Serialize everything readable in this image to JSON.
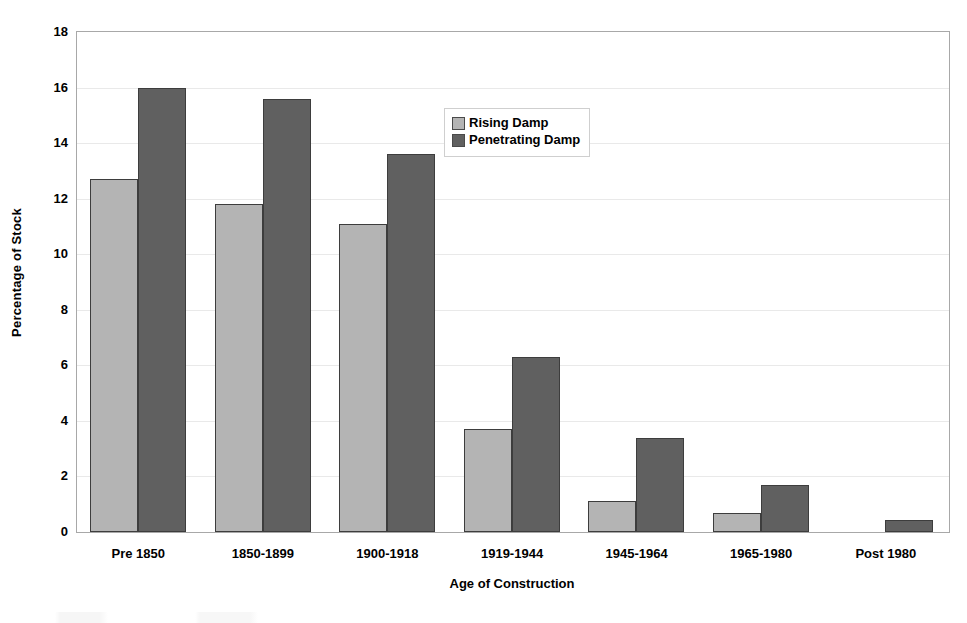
{
  "chart_data": {
    "type": "bar",
    "title": "",
    "xlabel": "Age of Construction",
    "ylabel": "Percentage of Stock",
    "categories": [
      "Pre 1850",
      "1850-1899",
      "1900-1918",
      "1919-1944",
      "1945-1964",
      "1965-1980",
      "Post 1980"
    ],
    "series": [
      {
        "name": "Rising Damp",
        "color": "#b4b4b4",
        "values": [
          12.7,
          11.8,
          11.1,
          3.7,
          1.1,
          0.7,
          null
        ]
      },
      {
        "name": "Penetrating Damp",
        "color": "#606060",
        "values": [
          16.0,
          15.6,
          13.6,
          6.3,
          3.4,
          1.7,
          0.45
        ]
      }
    ],
    "ylim": [
      0,
      18
    ],
    "yticks": [
      0,
      2,
      4,
      6,
      8,
      10,
      12,
      14,
      16,
      18
    ],
    "ytick_labels": [
      "0",
      "2",
      "4",
      "6",
      "8",
      "10",
      "12",
      "14",
      "16",
      "18"
    ],
    "grid": true,
    "grid_axis": "y",
    "legend_position": "upper center",
    "legend_entries": [
      "Rising Damp",
      "Penetrating Damp"
    ],
    "bar_border_color": "#3d3d3d",
    "plot_border_color": "#a8a8a8",
    "gridline_color": "#e9e9e9",
    "background_color": "#ffffff"
  }
}
